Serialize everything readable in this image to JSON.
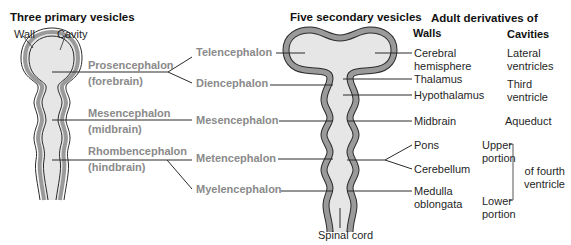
{
  "colors": {
    "wall": "#9a9a9a",
    "wall_outline": "#2b2b2b",
    "cavity": "#e6e6e6",
    "leader_line": "#2b2b2b",
    "gray_text": "#8a8a8a",
    "text": "#1a1a1a"
  },
  "primary": {
    "title": "Three primary vesicles",
    "wall_label": "Wall",
    "cavity_label": "Cavity",
    "vesicles": [
      {
        "name": "Prosencephalon",
        "common": "(forebrain)"
      },
      {
        "name": "Mesencephalon",
        "common": "(midbrain)"
      },
      {
        "name": "Rhombencephalon",
        "common": "(hindbrain)"
      }
    ]
  },
  "secondary": {
    "title": "Five secondary vesicles",
    "vesicles": [
      "Telencephalon",
      "Diencephalon",
      "Mesencephalon",
      "Metencephalon",
      "Myelencephalon"
    ],
    "spinal_cord_label": "Spinal cord"
  },
  "adult": {
    "title": "Adult derivatives of",
    "walls_header": "Walls",
    "cavities_header": "Cavities",
    "walls": {
      "cerebral_hemisphere": "Cerebral\nhemisphere",
      "thalamus": "Thalamus",
      "hypothalamus": "Hypothalamus",
      "midbrain": "Midbrain",
      "pons": "Pons",
      "cerebellum": "Cerebellum",
      "medulla": "Medulla\noblongata"
    },
    "cavities": {
      "lateral": "Lateral\nventricles",
      "third": "Third\nventricle",
      "aqueduct": "Aqueduct",
      "upper": "Upper\nportion",
      "lower": "Lower\nportion",
      "fourth": "of fourth\nventricle"
    }
  }
}
